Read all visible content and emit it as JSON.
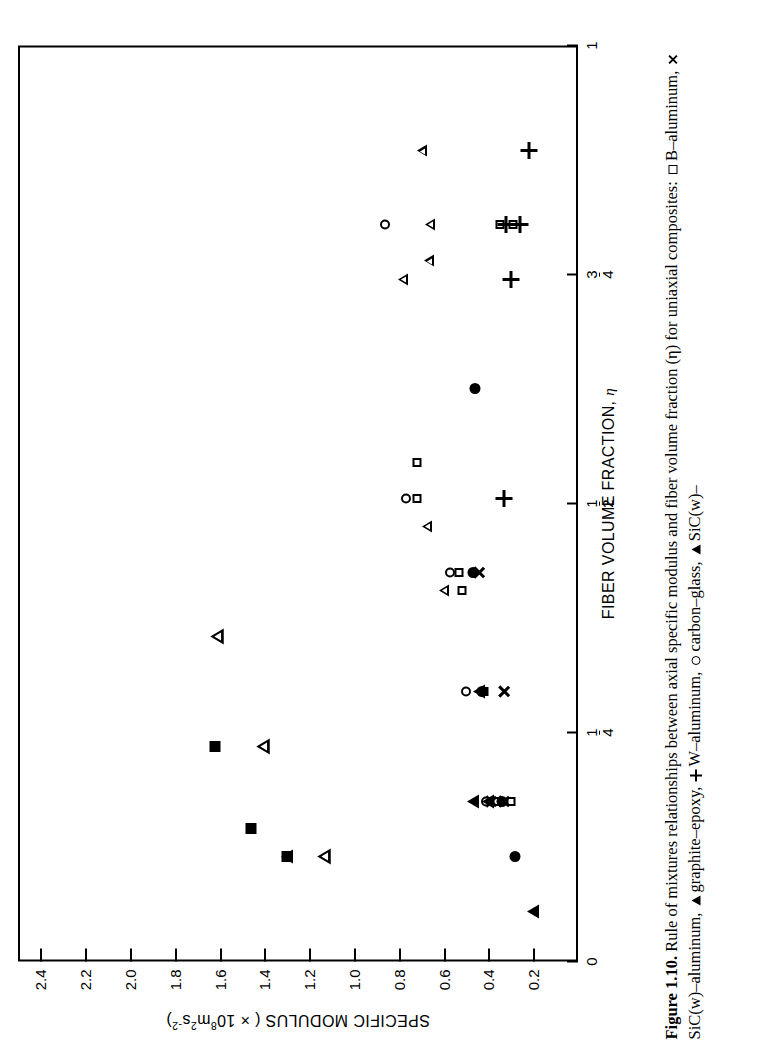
{
  "figure": {
    "number": "Figure 1.10.",
    "caption_main": "Rule of mixtures relationships between axial specific modulus and fiber volume fraction (η) for uniaxial composites:",
    "caption_line2_prefix": "ites:",
    "legend_entries": [
      {
        "symbol": "open-square",
        "label": "B–aluminum,"
      },
      {
        "symbol": "cross",
        "label": "SiC(w)–aluminum,"
      },
      {
        "symbol": "open-triangle",
        "label": "graphite–epoxy,"
      },
      {
        "symbol": "plus",
        "label": "W–aluminum,"
      },
      {
        "symbol": "open-circle",
        "label": "carbon–glass,"
      },
      {
        "symbol": "filled-triangle",
        "label": "SiC(w)–"
      }
    ]
  },
  "chart_data": {
    "type": "scatter",
    "title": "",
    "xlabel": "FIBER VOLUME FRACTION, η",
    "ylabel": "SPECIFIC MODULUS ( × 10⁸ m² s⁻² )",
    "ylabel_parts": {
      "text": "SPECIFIC MODULUS (",
      "times": "×",
      "base": "10",
      "exp1": "8",
      "unit1": "m",
      "exp2": "2",
      "unit2": "s",
      "exp3": "-2",
      "close": ")"
    },
    "xlim": [
      0,
      1
    ],
    "ylim": [
      0,
      2.5
    ],
    "grid": false,
    "legend_position": "caption",
    "xticks": [
      {
        "value": 0,
        "label": "0",
        "type": "int"
      },
      {
        "value": 0.25,
        "num": "1",
        "den": "4",
        "type": "frac"
      },
      {
        "value": 0.5,
        "num": "1",
        "den": "2",
        "type": "frac"
      },
      {
        "value": 0.75,
        "num": "3",
        "den": "4",
        "type": "frac"
      },
      {
        "value": 1,
        "label": "1",
        "type": "int"
      }
    ],
    "yticks": [
      0.2,
      0.4,
      0.6,
      0.8,
      1.0,
      1.2,
      1.4,
      1.6,
      1.8,
      2.0,
      2.2,
      2.4
    ],
    "ytick_labels": [
      "0.2",
      "0.4",
      "0.6",
      "0.8",
      "1.0",
      "1.2",
      "1.4",
      "1.6",
      "1.8",
      "2.0",
      "2.2",
      "2.4"
    ],
    "series": [
      {
        "name": "B–aluminum",
        "symbol": "open-square",
        "points": [
          [
            0.175,
            0.3
          ],
          [
            0.175,
            0.36
          ],
          [
            0.295,
            0.42
          ],
          [
            0.405,
            0.52
          ],
          [
            0.425,
            0.53
          ],
          [
            0.505,
            0.72
          ],
          [
            0.545,
            0.72
          ],
          [
            0.805,
            0.29
          ],
          [
            0.805,
            0.35
          ]
        ]
      },
      {
        "name": "SiC(w)–aluminum",
        "symbol": "cross",
        "points": [
          [
            0.175,
            0.33
          ],
          [
            0.175,
            0.39
          ],
          [
            0.295,
            0.33
          ],
          [
            0.425,
            0.44
          ]
        ]
      },
      {
        "name": "graphite–epoxy",
        "symbol": "open-triangle",
        "points": [
          [
            0.405,
            0.6
          ],
          [
            0.475,
            0.72
          ],
          [
            0.745,
            0.87
          ],
          [
            0.765,
            0.8
          ],
          [
            0.805,
            0.84
          ],
          [
            0.885,
            0.92
          ]
        ]
      },
      {
        "name": "W–aluminum",
        "symbol": "plus",
        "points": [
          [
            0.505,
            0.33
          ],
          [
            0.745,
            0.3
          ],
          [
            0.805,
            0.32
          ],
          [
            0.805,
            0.26
          ],
          [
            0.885,
            0.22
          ]
        ]
      },
      {
        "name": "carbon–glass",
        "symbol": "open-circle",
        "points": [
          [
            0.175,
            0.41
          ],
          [
            0.295,
            0.5
          ],
          [
            0.425,
            0.57
          ],
          [
            0.505,
            0.77
          ],
          [
            0.805,
            0.86
          ]
        ]
      },
      {
        "name": "SiC(w)",
        "symbol": "filled-triangle",
        "points": [
          [
            0.055,
            0.2
          ],
          [
            0.115,
            1.3
          ],
          [
            0.175,
            0.4
          ],
          [
            0.175,
            0.47
          ],
          [
            0.295,
            0.44
          ]
        ]
      },
      {
        "name": "filled-square-set",
        "symbol": "filled-square",
        "points": [
          [
            0.115,
            1.3
          ],
          [
            0.145,
            1.46
          ],
          [
            0.235,
            1.62
          ]
        ]
      },
      {
        "name": "filled-circle-set",
        "symbol": "filled-circle",
        "points": [
          [
            0.115,
            0.28
          ],
          [
            0.175,
            0.34
          ],
          [
            0.295,
            0.43
          ],
          [
            0.425,
            0.47
          ],
          [
            0.625,
            0.46
          ]
        ]
      },
      {
        "name": "open-left-triangle-set",
        "symbol": "open-triangle-large",
        "points": [
          [
            0.115,
            1.4
          ],
          [
            0.235,
            1.72
          ],
          [
            0.355,
            1.97
          ]
        ]
      }
    ]
  }
}
